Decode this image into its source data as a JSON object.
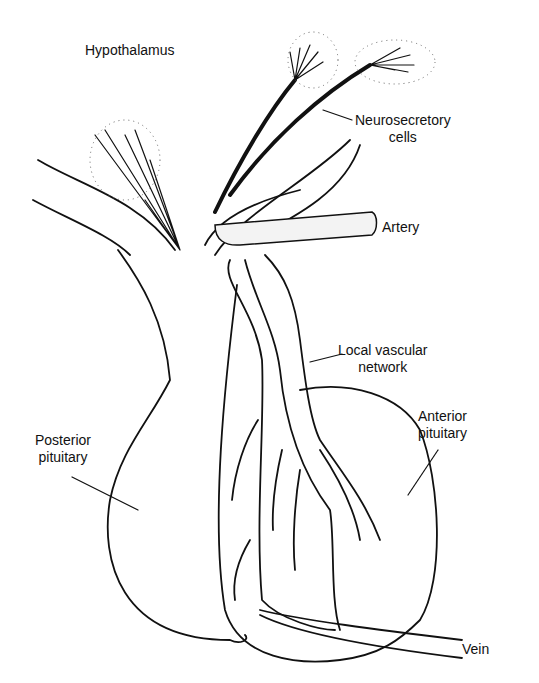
{
  "diagram": {
    "labels": {
      "hypothalamus": "Hypothalamus",
      "neurosecretory_1": "Neurosecretory",
      "neurosecretory_2": "cells",
      "artery": "Artery",
      "local_vascular_1": "Local vascular",
      "local_vascular_2": "network",
      "anterior_1": "Anterior",
      "anterior_2": "pituitary",
      "posterior_1": "Posterior",
      "posterior_2": "pituitary",
      "vein": "Vein"
    },
    "colors": {
      "ink": "#111111",
      "background": "#ffffff",
      "vessel_fill": "#f3f3f3"
    }
  }
}
